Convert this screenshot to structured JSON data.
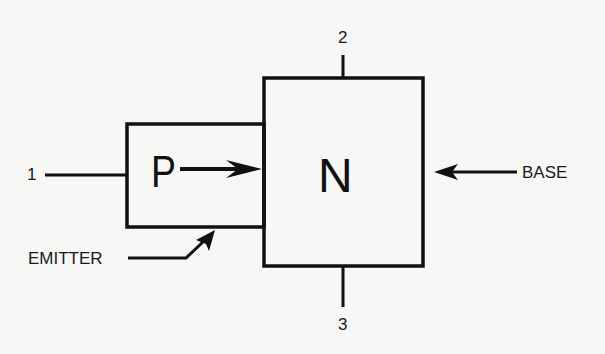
{
  "diagram": {
    "type": "PN junction (transistor emitter-base) block diagram",
    "regions": {
      "p": {
        "letter": "P"
      },
      "n": {
        "letter": "N"
      }
    },
    "terminals": {
      "t1": "1",
      "t2": "2",
      "t3": "3"
    },
    "labels": {
      "emitter": "EMITTER",
      "base": "BASE"
    },
    "colors": {
      "line": "#111111",
      "background": "#f7f7f6"
    }
  }
}
